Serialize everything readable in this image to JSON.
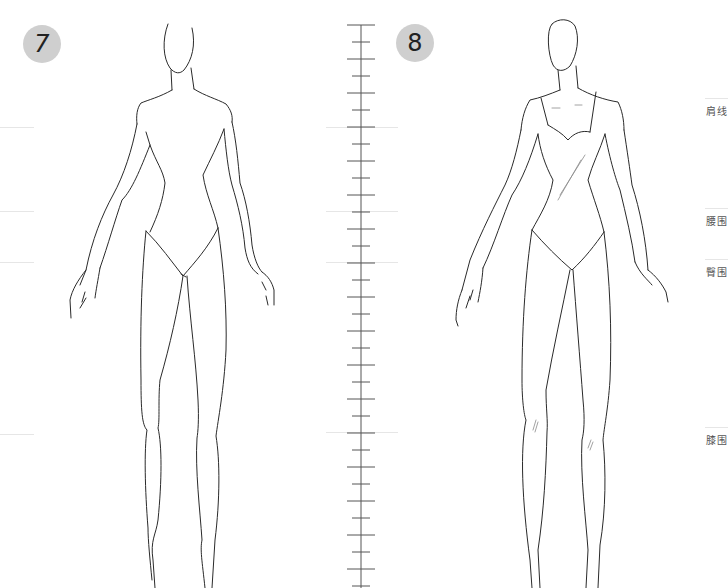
{
  "figures": [
    {
      "number": "7",
      "description": "blank female fashion croquis, front view"
    },
    {
      "number": "8",
      "description": "female fashion croquis wearing a sweetheart-neckline bodysuit, front view"
    }
  ],
  "guide_labels": {
    "shoulder": "肩线",
    "waist": "腰围",
    "hip": "臀围",
    "knee": "膝围"
  },
  "guides_y": {
    "shoulder": 127,
    "waist": 211,
    "hip": 262,
    "knee": 434
  },
  "ruler": {
    "x": 361,
    "top": 25,
    "bottom": 588,
    "tick_spacing": 17
  },
  "colors": {
    "badge_fill": "#cfcfcf",
    "stroke": "#2a2a2a",
    "guide": "#e6e6e6",
    "label": "#555555"
  }
}
